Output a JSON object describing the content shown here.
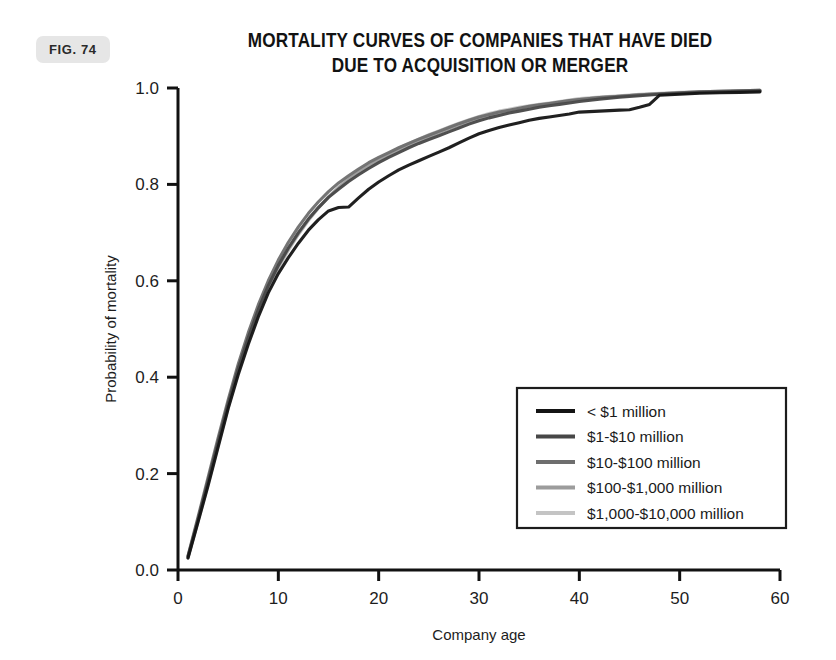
{
  "figure": {
    "badge_label": "FIG. 74"
  },
  "chart_data": {
    "type": "line",
    "title": "MORTALITY CURVES OF COMPANIES THAT HAVE DIED DUE TO ACQUISITION OR MERGER",
    "title_line_1": "MORTALITY CURVES OF COMPANIES THAT HAVE DIED",
    "title_line_2": "DUE TO ACQUISITION OR MERGER",
    "xlabel": "Company age",
    "ylabel": "Probability of mortality",
    "xlim": [
      0,
      60
    ],
    "ylim": [
      0,
      1.0
    ],
    "xticks": [
      0,
      10,
      20,
      30,
      40,
      50,
      60
    ],
    "xtick_labels": [
      "0",
      "10",
      "20",
      "30",
      "40",
      "50",
      "60"
    ],
    "yticks": [
      0.0,
      0.2,
      0.4,
      0.6,
      0.8,
      1.0
    ],
    "ytick_labels": [
      "0.0",
      "0.2",
      "0.4",
      "0.6",
      "0.8",
      "1.0"
    ],
    "grid": false,
    "legend_position": "center-right",
    "series": [
      {
        "name": "< $1 million",
        "color": "#141414",
        "width": 3.1,
        "x": [
          1,
          2,
          3,
          4,
          5,
          6,
          7,
          8,
          9,
          10,
          11,
          12,
          13,
          14,
          15,
          16,
          17,
          18,
          19,
          20,
          21,
          22,
          23,
          24,
          25,
          26,
          27,
          28,
          29,
          30,
          31,
          32,
          33,
          34,
          35,
          36,
          37,
          38,
          39,
          40,
          41,
          42,
          43,
          44,
          45,
          46,
          47,
          48,
          49,
          50,
          52,
          54,
          56,
          58
        ],
        "y": [
          0.025,
          0.1,
          0.175,
          0.255,
          0.335,
          0.405,
          0.468,
          0.525,
          0.575,
          0.615,
          0.648,
          0.678,
          0.705,
          0.727,
          0.745,
          0.752,
          0.753,
          0.772,
          0.79,
          0.805,
          0.818,
          0.83,
          0.84,
          0.849,
          0.858,
          0.867,
          0.876,
          0.886,
          0.896,
          0.905,
          0.912,
          0.918,
          0.923,
          0.928,
          0.933,
          0.937,
          0.94,
          0.943,
          0.946,
          0.95,
          0.951,
          0.952,
          0.953,
          0.954,
          0.955,
          0.96,
          0.966,
          0.985,
          0.986,
          0.987,
          0.989,
          0.99,
          0.991,
          0.992
        ]
      },
      {
        "name": "$1-$10 million",
        "color": "#474747",
        "width": 3.1,
        "x": [
          1,
          2,
          3,
          4,
          5,
          6,
          7,
          8,
          9,
          10,
          11,
          12,
          13,
          14,
          15,
          16,
          17,
          18,
          19,
          20,
          21,
          22,
          23,
          24,
          25,
          26,
          27,
          28,
          29,
          30,
          31,
          32,
          33,
          34,
          35,
          36,
          37,
          38,
          39,
          40,
          42,
          44,
          46,
          48,
          50,
          52,
          54,
          56,
          58
        ],
        "y": [
          0.028,
          0.105,
          0.185,
          0.266,
          0.345,
          0.418,
          0.482,
          0.54,
          0.59,
          0.632,
          0.668,
          0.7,
          0.728,
          0.752,
          0.773,
          0.79,
          0.806,
          0.82,
          0.833,
          0.845,
          0.856,
          0.866,
          0.876,
          0.885,
          0.893,
          0.901,
          0.909,
          0.917,
          0.925,
          0.932,
          0.938,
          0.943,
          0.948,
          0.952,
          0.956,
          0.96,
          0.963,
          0.966,
          0.969,
          0.972,
          0.977,
          0.981,
          0.984,
          0.987,
          0.989,
          0.991,
          0.992,
          0.993,
          0.994
        ]
      },
      {
        "name": "$10-$100 million",
        "color": "#6e6e6e",
        "width": 3.1,
        "x": [
          1,
          2,
          3,
          4,
          5,
          6,
          7,
          8,
          9,
          10,
          11,
          12,
          13,
          14,
          15,
          16,
          17,
          18,
          19,
          20,
          21,
          22,
          23,
          24,
          25,
          26,
          27,
          28,
          29,
          30,
          31,
          32,
          33,
          34,
          35,
          36,
          37,
          38,
          39,
          40,
          42,
          44,
          46,
          48,
          50,
          52,
          54,
          56,
          58
        ],
        "y": [
          0.03,
          0.11,
          0.192,
          0.274,
          0.353,
          0.427,
          0.492,
          0.55,
          0.6,
          0.643,
          0.68,
          0.712,
          0.74,
          0.764,
          0.785,
          0.803,
          0.818,
          0.832,
          0.845,
          0.856,
          0.866,
          0.876,
          0.885,
          0.894,
          0.902,
          0.91,
          0.918,
          0.926,
          0.933,
          0.94,
          0.945,
          0.95,
          0.954,
          0.958,
          0.962,
          0.965,
          0.968,
          0.971,
          0.974,
          0.976,
          0.98,
          0.983,
          0.986,
          0.988,
          0.99,
          0.992,
          0.993,
          0.994,
          0.995
        ]
      },
      {
        "name": "$100-$1,000 million",
        "color": "#9c9c9c",
        "width": 3.1,
        "x": [
          1,
          2,
          3,
          4,
          5,
          6,
          7,
          8,
          9,
          10,
          11,
          12,
          13,
          14,
          15,
          16,
          17,
          18,
          19,
          20,
          21,
          22,
          23,
          24,
          25,
          26,
          27,
          28,
          29,
          30,
          31,
          32,
          33,
          34,
          35,
          36,
          37,
          38,
          39,
          40,
          42,
          44,
          46,
          48,
          50,
          52,
          54,
          56,
          58
        ],
        "y": [
          0.026,
          0.103,
          0.183,
          0.264,
          0.344,
          0.416,
          0.48,
          0.537,
          0.587,
          0.63,
          0.666,
          0.698,
          0.727,
          0.752,
          0.774,
          0.793,
          0.81,
          0.825,
          0.838,
          0.85,
          0.861,
          0.871,
          0.881,
          0.89,
          0.899,
          0.907,
          0.915,
          0.923,
          0.93,
          0.937,
          0.943,
          0.948,
          0.953,
          0.957,
          0.961,
          0.964,
          0.967,
          0.97,
          0.973,
          0.976,
          0.98,
          0.983,
          0.986,
          0.988,
          0.99,
          0.992,
          0.993,
          0.994,
          0.995
        ]
      },
      {
        "name": "$1,000-$10,000 million",
        "color": "#c4c4c4",
        "width": 3.1,
        "x": [
          1,
          2,
          3,
          4,
          5,
          6,
          7,
          8,
          9,
          10,
          11,
          12,
          13,
          14,
          15,
          16,
          17,
          18,
          19,
          20,
          21,
          22,
          23,
          24,
          25,
          26,
          27,
          28,
          29,
          30,
          31,
          32,
          33,
          34,
          35,
          36,
          37,
          38,
          39,
          40,
          42,
          44,
          46,
          48,
          50,
          52,
          54,
          56,
          58
        ],
        "y": [
          0.024,
          0.1,
          0.178,
          0.258,
          0.337,
          0.41,
          0.474,
          0.532,
          0.582,
          0.626,
          0.663,
          0.696,
          0.725,
          0.751,
          0.774,
          0.794,
          0.812,
          0.827,
          0.841,
          0.853,
          0.864,
          0.875,
          0.885,
          0.894,
          0.903,
          0.911,
          0.919,
          0.927,
          0.934,
          0.941,
          0.947,
          0.952,
          0.956,
          0.96,
          0.963,
          0.966,
          0.969,
          0.972,
          0.975,
          0.978,
          0.981,
          0.984,
          0.987,
          0.989,
          0.991,
          0.992,
          0.993,
          0.994,
          0.995
        ]
      }
    ],
    "legend_entries": [
      {
        "label": "< $1 million",
        "color": "#141414"
      },
      {
        "label": "$1-$10 million",
        "color": "#474747"
      },
      {
        "label": "$10-$100 million",
        "color": "#6e6e6e"
      },
      {
        "label": "$100-$1,000 million",
        "color": "#9c9c9c"
      },
      {
        "label": "$1,000-$10,000 million",
        "color": "#c4c4c4"
      }
    ]
  }
}
